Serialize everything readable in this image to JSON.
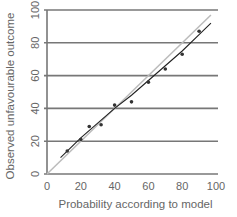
{
  "chart_data": {
    "type": "scatter",
    "title": "",
    "xlabel": "Probability according to model",
    "ylabel": "Observed unfavourable outcome",
    "xlim": [
      0,
      100
    ],
    "ylim": [
      0,
      100
    ],
    "x_ticks": [
      0,
      20,
      40,
      60,
      80,
      100
    ],
    "y_ticks": [
      0,
      20,
      40,
      60,
      80,
      100
    ],
    "grid": "horizontal",
    "series": [
      {
        "name": "Observed",
        "kind": "points",
        "x": [
          12,
          20,
          25,
          32,
          40,
          50,
          60,
          70,
          80,
          90
        ],
        "y": [
          14,
          21,
          29,
          30,
          42,
          44,
          56,
          64,
          73,
          87
        ]
      },
      {
        "name": "Fitted line",
        "kind": "line",
        "x": [
          8,
          20,
          30,
          40,
          50,
          60,
          70,
          80,
          90,
          97
        ],
        "y": [
          10,
          22,
          31,
          40,
          48,
          57,
          66,
          75,
          85,
          92
        ]
      },
      {
        "name": "Line of identity",
        "kind": "line",
        "x": [
          0,
          97
        ],
        "y": [
          0,
          97
        ]
      }
    ],
    "colors": {
      "grid": "#777777",
      "points": "#333333",
      "fit_line": "#222222",
      "identity_line": "#bbbbbb",
      "text": "#666666"
    }
  }
}
